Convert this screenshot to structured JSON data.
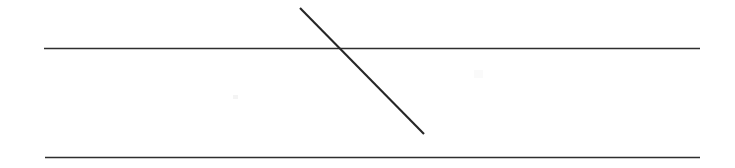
{
  "figure": {
    "title": "Two parallel horizontal lines crossed by a transversal",
    "background_color": "#ffffff",
    "width": 735,
    "height": 168,
    "stroke_color": "#262626",
    "line_color_horizontal": "#2e2e2e",
    "line_color_diagonal": "#262626"
  },
  "chart_data": {
    "type": "line",
    "title": "",
    "xlabel": "",
    "ylabel": "",
    "grid": false,
    "legend": "none",
    "xlim": [
      0,
      735
    ],
    "ylim": [
      168,
      0
    ],
    "series": [
      {
        "name": "top-horizontal-line",
        "role": "parallel-line-1",
        "stroke": "#2e2e2e",
        "stroke_width": 1.6,
        "x": [
          44,
          700
        ],
        "y": [
          48.5,
          48.5
        ]
      },
      {
        "name": "bottom-horizontal-line",
        "role": "parallel-line-2",
        "stroke": "#2e2e2e",
        "stroke_width": 1.6,
        "x": [
          45,
          700
        ],
        "y": [
          157.5,
          157.5
        ]
      },
      {
        "name": "diagonal-transversal-line",
        "role": "transversal",
        "stroke": "#262626",
        "stroke_width": 2.1,
        "x": [
          300,
          424
        ],
        "y": [
          8,
          134
        ]
      }
    ],
    "annotations": [
      {
        "name": "intersection-point",
        "x": 344,
        "y": 48.5,
        "label": ""
      },
      {
        "name": "scan-speck-right",
        "x": 478,
        "y": 74,
        "label": ""
      },
      {
        "name": "scan-speck-left",
        "x": 236,
        "y": 97,
        "label": ""
      }
    ]
  },
  "elements": {
    "top_line_label": "",
    "bottom_line_label": "",
    "diagonal_line_label": ""
  }
}
